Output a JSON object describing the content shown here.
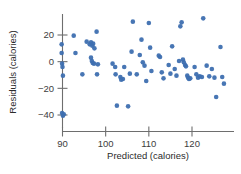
{
  "chart_data": {
    "type": "scatter",
    "title": "",
    "xlabel": "Predicted (calories)",
    "ylabel": "Residuals (calories)",
    "xticks": [
      90,
      100,
      110,
      120
    ],
    "yticks": [
      20,
      0,
      -20,
      -40
    ],
    "xlim": [
      87.5,
      128.5
    ],
    "ylim": [
      -45,
      34
    ],
    "grid": false,
    "legend": null,
    "marker": {
      "shape": "circle",
      "color": "#3e6fb0",
      "size_px": 4.6,
      "opacity": 0.95
    },
    "point_count": 79,
    "points": [
      {
        "x": 89.8,
        "y": 13.0
      },
      {
        "x": 89.8,
        "y": 6.5
      },
      {
        "x": 89.9,
        "y": -1.5
      },
      {
        "x": 90.0,
        "y": -4.0
      },
      {
        "x": 90.1,
        "y": -10.5
      },
      {
        "x": 89.9,
        "y": -38.5
      },
      {
        "x": 90.1,
        "y": -40.5
      },
      {
        "x": 90.3,
        "y": -39.5
      },
      {
        "x": 92.6,
        "y": 19.5
      },
      {
        "x": 93.0,
        "y": 6.5
      },
      {
        "x": 94.6,
        "y": -9.5
      },
      {
        "x": 95.6,
        "y": 15.0
      },
      {
        "x": 96.3,
        "y": 13.0
      },
      {
        "x": 96.6,
        "y": 14.5
      },
      {
        "x": 96.9,
        "y": 12.0
      },
      {
        "x": 97.1,
        "y": 13.5
      },
      {
        "x": 96.6,
        "y": 3.0
      },
      {
        "x": 96.8,
        "y": 0.5
      },
      {
        "x": 97.0,
        "y": -1.0
      },
      {
        "x": 97.3,
        "y": -1.5
      },
      {
        "x": 97.4,
        "y": 10.0
      },
      {
        "x": 97.9,
        "y": 22.5
      },
      {
        "x": 98.2,
        "y": -2.0
      },
      {
        "x": 98.0,
        "y": -9.5
      },
      {
        "x": 101.6,
        "y": -1.5
      },
      {
        "x": 102.2,
        "y": -4.0
      },
      {
        "x": 102.3,
        "y": -9.5
      },
      {
        "x": 102.6,
        "y": -33.0
      },
      {
        "x": 103.4,
        "y": -11.5
      },
      {
        "x": 103.6,
        "y": -13.5
      },
      {
        "x": 104.0,
        "y": -13.0
      },
      {
        "x": 104.3,
        "y": -4.0
      },
      {
        "x": 105.2,
        "y": -33.5
      },
      {
        "x": 105.6,
        "y": -9.0
      },
      {
        "x": 106.0,
        "y": 7.5
      },
      {
        "x": 106.3,
        "y": 30.0
      },
      {
        "x": 107.2,
        "y": -9.5
      },
      {
        "x": 107.9,
        "y": 5.0
      },
      {
        "x": 108.3,
        "y": 16.5
      },
      {
        "x": 108.6,
        "y": -0.5
      },
      {
        "x": 109.0,
        "y": -3.0
      },
      {
        "x": 109.4,
        "y": -14.5
      },
      {
        "x": 110.0,
        "y": 29.0
      },
      {
        "x": 110.3,
        "y": 10.5
      },
      {
        "x": 110.6,
        "y": -7.0
      },
      {
        "x": 112.3,
        "y": 4.5
      },
      {
        "x": 112.6,
        "y": 3.5
      },
      {
        "x": 113.0,
        "y": -8.0
      },
      {
        "x": 113.4,
        "y": -12.5
      },
      {
        "x": 114.6,
        "y": -2.5
      },
      {
        "x": 115.0,
        "y": -9.0
      },
      {
        "x": 115.4,
        "y": 11.5
      },
      {
        "x": 116.0,
        "y": -5.5
      },
      {
        "x": 116.4,
        "y": -10.5
      },
      {
        "x": 117.0,
        "y": 0.5
      },
      {
        "x": 117.3,
        "y": 26.5
      },
      {
        "x": 117.6,
        "y": 29.5
      },
      {
        "x": 117.9,
        "y": 1.5
      },
      {
        "x": 118.1,
        "y": -0.5
      },
      {
        "x": 118.4,
        "y": -2.5
      },
      {
        "x": 118.6,
        "y": -3.5
      },
      {
        "x": 118.9,
        "y": -10.5
      },
      {
        "x": 119.1,
        "y": -12.0
      },
      {
        "x": 119.3,
        "y": -13.0
      },
      {
        "x": 119.6,
        "y": -12.5
      },
      {
        "x": 120.6,
        "y": -4.0
      },
      {
        "x": 121.0,
        "y": -9.5
      },
      {
        "x": 121.4,
        "y": -12.0
      },
      {
        "x": 121.8,
        "y": -11.0
      },
      {
        "x": 122.3,
        "y": -11.5
      },
      {
        "x": 122.6,
        "y": 32.5
      },
      {
        "x": 123.4,
        "y": -3.0
      },
      {
        "x": 124.0,
        "y": -11.0
      },
      {
        "x": 124.6,
        "y": -5.5
      },
      {
        "x": 125.2,
        "y": -12.0
      },
      {
        "x": 125.6,
        "y": -26.5
      },
      {
        "x": 126.6,
        "y": 11.0
      },
      {
        "x": 127.0,
        "y": -11.5
      },
      {
        "x": 127.4,
        "y": -16.5
      }
    ]
  },
  "axes": {
    "x_tick_labels": [
      "90",
      "100",
      "110",
      "120"
    ],
    "y_tick_labels": [
      "20",
      "0",
      "−20",
      "−40"
    ],
    "x_axis_title": "Predicted (calories)",
    "y_axis_title": "Residuals (calories)",
    "axis_color": "#6e6e6e",
    "tick_text_color": "#3d3d3d"
  }
}
